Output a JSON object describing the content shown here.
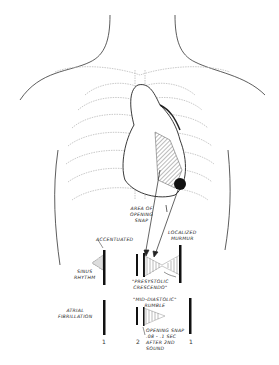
{
  "diagram": {
    "labels": {
      "area_of_opening_snap": [
        "AREA OF",
        "OPENING",
        "SNAP"
      ],
      "localized_murmur": [
        "LOCALIZED",
        "MURMUR"
      ],
      "accentuated": "ACCENTUATED",
      "sinus_rhythm": [
        "SINUS",
        "RHYTHM"
      ],
      "presystolic_crescendo": [
        "\"PRESYSTOLIC",
        "CRESCENDO\""
      ],
      "atrial_fibrillation": [
        "ATRIAL",
        "FIBRILLATION"
      ],
      "mid_diastolic_rumble": [
        "\"MID-DIASTOLIC\"",
        "RUMBLE"
      ],
      "opening_snap_timing": [
        "OPENING SNAP",
        ".08 - .1 SEC",
        "AFTER 2ND",
        "SOUND"
      ]
    },
    "sound_numbers": {
      "first_a": "1",
      "second": "2",
      "first_b": "1"
    },
    "colors": {
      "line": "#222222",
      "ribs": "#bbbbbb",
      "hatch": "#777777"
    }
  }
}
